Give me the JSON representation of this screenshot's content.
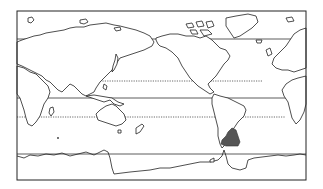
{
  "map": {
    "projection": "pacific-centered world outline",
    "frame": {
      "x": 17,
      "y": 11,
      "width": 289,
      "height": 169
    },
    "latitude_lines": [
      {
        "name": "arctic-circle",
        "y": 39,
        "style": "solid"
      },
      {
        "name": "tropic-of-cancer",
        "y": 81,
        "style": "dotted"
      },
      {
        "name": "equator",
        "y": 98,
        "style": "solid"
      },
      {
        "name": "tropic-of-capricorn",
        "y": 117,
        "style": "dotted"
      },
      {
        "name": "antarctic-circle",
        "y": 154,
        "style": "solid"
      }
    ],
    "highlighted_region": {
      "name": "southern-south-america",
      "color": "#555555"
    },
    "colors": {
      "background": "#ffffff",
      "outline": "#222222",
      "highlight": "#555555"
    }
  }
}
